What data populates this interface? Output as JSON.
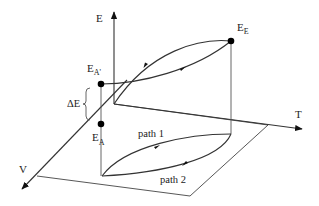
{
  "diagram": {
    "axes": {
      "e_label": "E",
      "t_label": "T",
      "v_label": "V"
    },
    "points": {
      "e_a_prime": {
        "main": "E",
        "sub": "A'"
      },
      "e_a": {
        "main": "E",
        "sub": "A"
      },
      "e_e": {
        "main": "E",
        "sub": "E"
      }
    },
    "delta_e_label": "ΔE",
    "paths": {
      "path1_label": "path 1",
      "path2_label": "path 2"
    },
    "colors": {
      "line": "#333333",
      "dot": "#000000"
    }
  }
}
